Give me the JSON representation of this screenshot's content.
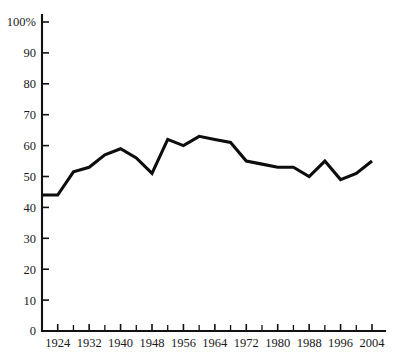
{
  "chart_data": {
    "type": "line",
    "title": "",
    "subtitle": "",
    "xlabel": "",
    "ylabel": "",
    "xlim": [
      1920,
      2005
    ],
    "ylim": [
      0,
      100
    ],
    "grid": false,
    "legend_position": "none",
    "y_tick_labels": [
      "0",
      "10",
      "20",
      "30",
      "40",
      "50",
      "60",
      "70",
      "80",
      "90",
      "100%"
    ],
    "y_ticks": [
      0,
      10,
      20,
      30,
      40,
      50,
      60,
      70,
      80,
      90,
      100
    ],
    "x_tick_labels": [
      "1924",
      "1932",
      "1940",
      "1948",
      "1956",
      "1964",
      "1972",
      "1980",
      "1988",
      "1996",
      "2004"
    ],
    "x_major_ticks": [
      1924,
      1932,
      1940,
      1948,
      1956,
      1964,
      1972,
      1980,
      1988,
      1996,
      2004
    ],
    "x_minor_ticks": [
      1928,
      1936,
      1944,
      1952,
      1960,
      1968,
      1976,
      1984,
      1992,
      2000
    ],
    "series": [
      {
        "name": "Turnout",
        "color": "#0d0d0d",
        "x": [
          1920,
          1924,
          1928,
          1932,
          1936,
          1940,
          1944,
          1948,
          1952,
          1956,
          1960,
          1964,
          1968,
          1972,
          1976,
          1980,
          1984,
          1988,
          1992,
          1996,
          2000,
          2004
        ],
        "values": [
          44,
          44,
          51.5,
          53,
          57,
          59,
          56,
          51,
          62,
          60,
          63,
          62,
          61,
          55,
          54,
          53,
          53,
          50,
          55,
          49,
          51,
          55
        ]
      }
    ]
  },
  "axes": {
    "y_axis_unit_suffix": "%",
    "x_axis_step_years": 4,
    "x_axis_label_step_years": 8
  }
}
